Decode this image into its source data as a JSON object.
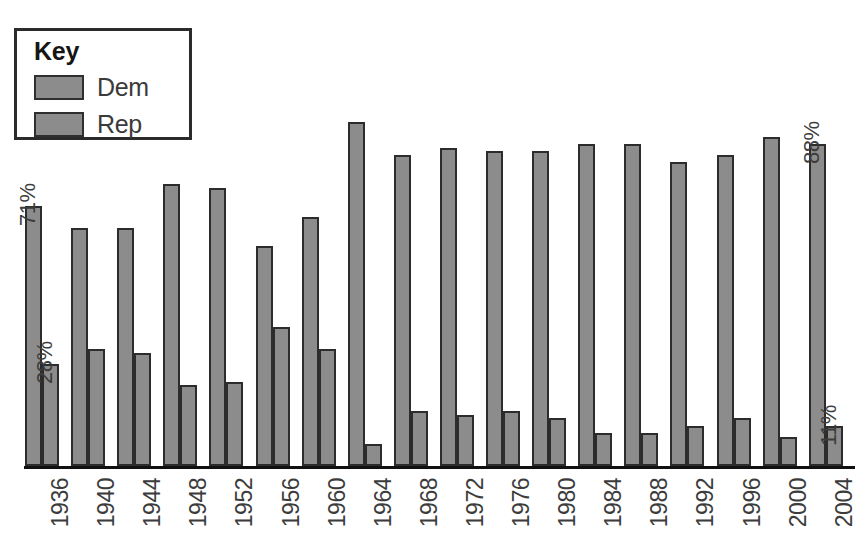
{
  "legend": {
    "title": "Key",
    "items": [
      {
        "label": "Dem",
        "color": "#8c8c8c"
      },
      {
        "label": "Rep",
        "color": "#8c8c8c"
      }
    ]
  },
  "annotations": [
    {
      "text": "71%",
      "series": "Dem",
      "category": "1936"
    },
    {
      "text": "28%",
      "series": "Rep",
      "category": "1936"
    },
    {
      "text": "88%",
      "series": "Dem",
      "category": "2004"
    },
    {
      "text": "11%",
      "series": "Rep",
      "category": "2004"
    }
  ],
  "chart_data": {
    "type": "bar",
    "title": "",
    "xlabel": "",
    "ylabel": "",
    "ylim": [
      0,
      100
    ],
    "grid": false,
    "legend_position": "top-left",
    "categories": [
      "1936",
      "1940",
      "1944",
      "1948",
      "1952",
      "1956",
      "1960",
      "1964",
      "1968",
      "1972",
      "1976",
      "1980",
      "1984",
      "1988",
      "1992",
      "1996",
      "2000",
      "2004"
    ],
    "series": [
      {
        "name": "Dem",
        "color": "#8c8c8c",
        "values": [
          71,
          65,
          65,
          77,
          76,
          60,
          68,
          94,
          85,
          87,
          86,
          86,
          88,
          88,
          83,
          85,
          90,
          88
        ]
      },
      {
        "name": "Rep",
        "color": "#8c8c8c",
        "values": [
          28,
          32,
          31,
          22,
          23,
          38,
          32,
          6,
          15,
          14,
          15,
          13,
          9,
          9,
          11,
          13,
          8,
          11
        ]
      }
    ]
  }
}
